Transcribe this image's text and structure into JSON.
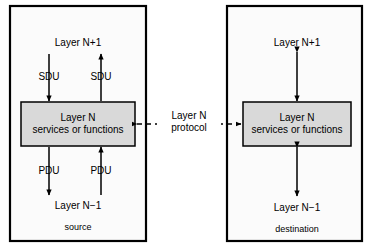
{
  "figure": {
    "colors": {
      "outer_box_fill": "#fbfbfb",
      "outer_box_stroke": "#000000",
      "inner_box_fill": "#d9d9d9",
      "inner_box_stroke": "#000000",
      "arrow": "#000000",
      "background": "#ffffff"
    }
  },
  "source_side": {
    "container_label": "source",
    "top_label": "Layer N+1",
    "bottom_label": "Layer N−1",
    "inner_box_line1": "Layer N",
    "inner_box_line2": "services or functions",
    "arrow_labels": {
      "sdu_down": "SDU",
      "sdu_up": "SDU",
      "pdu_down": "PDU",
      "pdu_up": "PDU"
    }
  },
  "destination_side": {
    "container_label": "destination",
    "top_label": "Layer N+1",
    "bottom_label": "Layer N−1",
    "inner_box_line1": "Layer N",
    "inner_box_line2": "services or functions"
  },
  "protocol_link": {
    "line1": "Layer N",
    "line2": "protocol",
    "style": "dashed-double-arrow"
  }
}
